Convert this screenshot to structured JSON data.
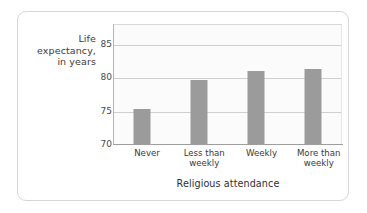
{
  "chart_data": {
    "type": "bar",
    "title": "",
    "categories": [
      "Never",
      "Less than weekly",
      "Weekly",
      "More than weekly"
    ],
    "values": [
      75.2,
      79.6,
      80.9,
      81.3
    ],
    "xlabel": "Religious attendance",
    "ylabel": "Life expectancy, in years",
    "ylabel_lines": [
      "Life",
      "expectancy,",
      "in years"
    ],
    "yticks": [
      70,
      75,
      80,
      85
    ],
    "ytick_labels": [
      "70",
      "75",
      "80",
      "85"
    ],
    "ylim": [
      70,
      88
    ],
    "grid": true,
    "grid_axis": "y",
    "legend": false,
    "legend_position": "none",
    "bar_color": "#9b9b9b",
    "plot_background": "#fbfbfb",
    "gridline_color": "#cfcfcf",
    "axis_color": "#9e9e9e",
    "card_border_color": "#d6d6d6"
  },
  "category_labels": [
    {
      "line1": "Never",
      "line2": ""
    },
    {
      "line1": "Less than",
      "line2": "weekly"
    },
    {
      "line1": "Weekly",
      "line2": ""
    },
    {
      "line1": "More than",
      "line2": "weekly"
    }
  ]
}
